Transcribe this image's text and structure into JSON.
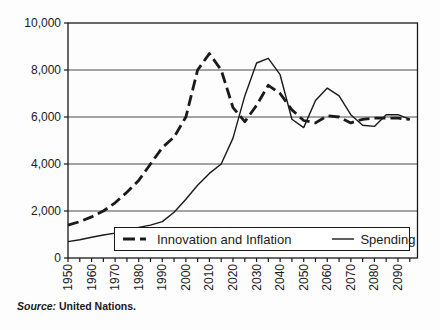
{
  "figure": {
    "source_prefix": "Source:",
    "source_text": " United Nations."
  },
  "legend": {
    "items": [
      {
        "label": "Innovation and Inflation",
        "style": "dashed"
      },
      {
        "label": "Spending",
        "style": "solid"
      }
    ]
  },
  "axes": {
    "y_ticks": [
      "0",
      "2,000",
      "4,000",
      "6,000",
      "8,000",
      "10,000"
    ],
    "y_tick_values": [
      0,
      2000,
      4000,
      6000,
      8000,
      10000
    ],
    "x_tick_labels": [
      "1950",
      "1960",
      "1970",
      "1980",
      "1990",
      "2000",
      "2010",
      "2020",
      "2030",
      "2040",
      "2050",
      "2060",
      "2070",
      "2080",
      "2090"
    ],
    "x_minor_tick_step_years": 5
  },
  "chart_data": {
    "type": "line",
    "title": "",
    "xlabel": "",
    "ylabel": "",
    "ylim": [
      0,
      10000
    ],
    "xlim": [
      1950,
      2098
    ],
    "grid": "horizontal",
    "legend_position": "bottom-inside",
    "x": [
      1950,
      1955,
      1960,
      1965,
      1970,
      1975,
      1980,
      1985,
      1990,
      1995,
      2000,
      2005,
      2010,
      2015,
      2020,
      2025,
      2030,
      2035,
      2040,
      2045,
      2050,
      2055,
      2060,
      2065,
      2070,
      2075,
      2080,
      2085,
      2090,
      2095
    ],
    "series": [
      {
        "name": "Innovation and Inflation",
        "line_style": "dashed",
        "color": "#1a1a1a",
        "values": [
          1400,
          1550,
          1750,
          2000,
          2350,
          2800,
          3300,
          4000,
          4700,
          5150,
          6000,
          8000,
          8700,
          8000,
          6400,
          5800,
          6500,
          7350,
          7000,
          6300,
          5850,
          5750,
          6050,
          6000,
          5750,
          5900,
          5950,
          5950,
          5950,
          5900
        ]
      },
      {
        "name": "Spending",
        "line_style": "solid",
        "color": "#1a1a1a",
        "values": [
          700,
          780,
          880,
          980,
          1060,
          1160,
          1300,
          1400,
          1550,
          1950,
          2500,
          3100,
          3600,
          4000,
          5100,
          6900,
          8300,
          8500,
          7800,
          5900,
          5550,
          6700,
          7230,
          6900,
          6100,
          5650,
          5600,
          6100,
          6100,
          5900
        ]
      }
    ],
    "source": "Source: United Nations."
  }
}
